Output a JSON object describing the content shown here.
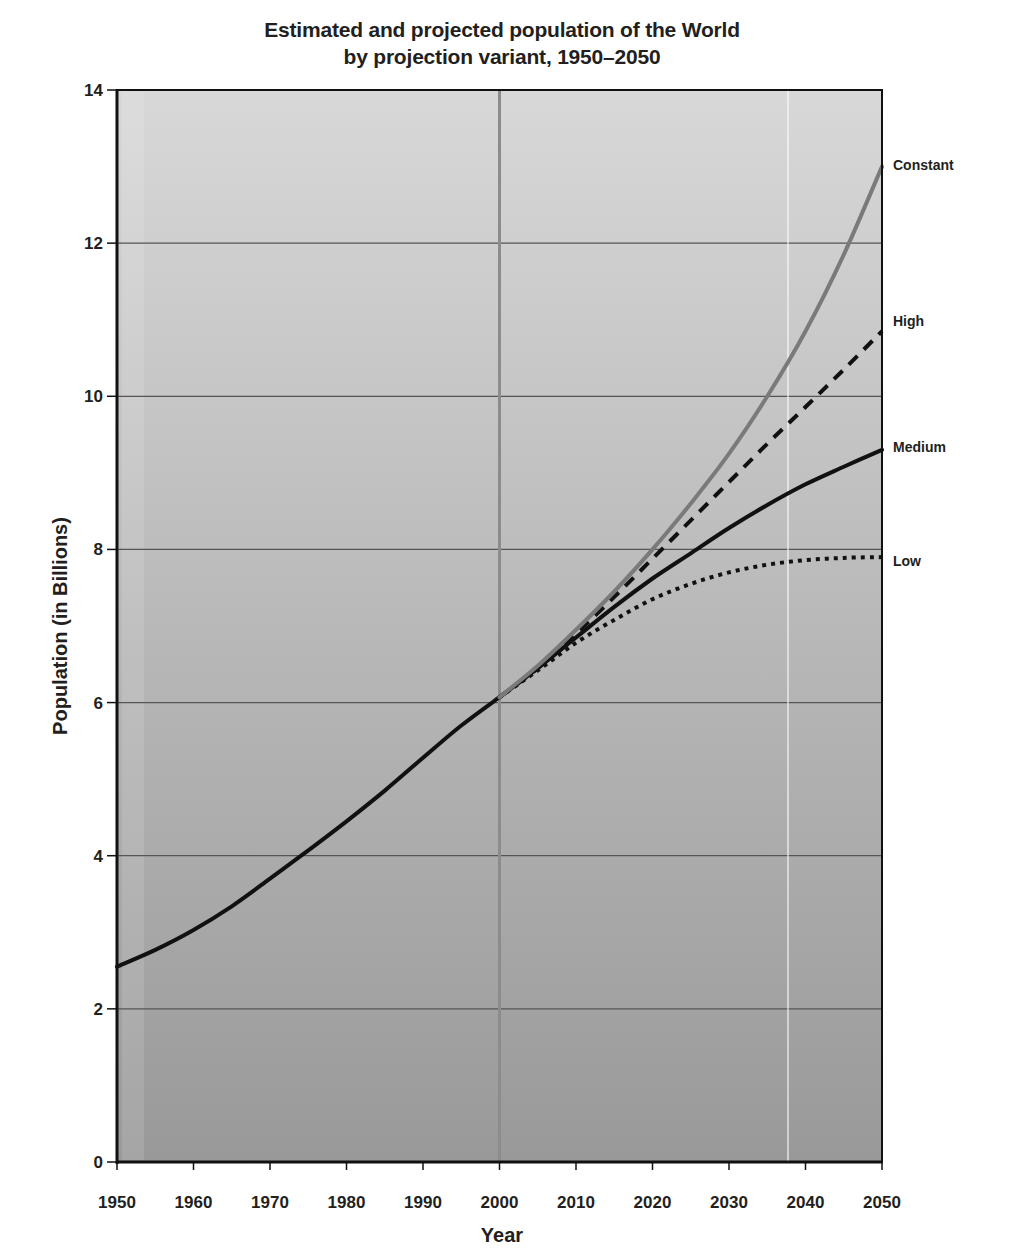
{
  "title": {
    "line1": "Estimated and projected population of the World",
    "line2": "by projection variant, 1950–2050"
  },
  "colors": {
    "background_top": "#d8d8d8",
    "background_bottom": "#999999",
    "estimate": "#111111",
    "constant": "#7a7a7a",
    "high": "#111111",
    "medium": "#111111",
    "low": "#111111",
    "gridline": "#555555",
    "year_2000_line": "#8c8c8c"
  },
  "chart_data": {
    "type": "line",
    "title": "Estimated and projected population of the World by projection variant, 1950–2050",
    "xlabel": "Year",
    "ylabel": "Population (in Billions)",
    "xlim": [
      1950,
      2050
    ],
    "ylim": [
      0,
      14
    ],
    "x_ticks": [
      "1950",
      "1960",
      "1970",
      "1980",
      "1990",
      "2000",
      "2010",
      "2020",
      "2030",
      "2040",
      "2050"
    ],
    "y_ticks": [
      "0",
      "2",
      "4",
      "6",
      "8",
      "10",
      "12",
      "14"
    ],
    "grid": "horizontal",
    "legend_position": "right, direct labels at line ends",
    "series": [
      {
        "name": "Estimate",
        "style": "solid black",
        "x": [
          1950,
          1955,
          1960,
          1965,
          1970,
          1975,
          1980,
          1985,
          1990,
          1995,
          2000
        ],
        "values": [
          2.55,
          2.77,
          3.03,
          3.34,
          3.7,
          4.07,
          4.45,
          4.85,
          5.28,
          5.7,
          6.07
        ]
      },
      {
        "name": "Constant",
        "style": "solid gray",
        "x": [
          2000,
          2005,
          2010,
          2015,
          2020,
          2025,
          2030,
          2035,
          2040,
          2045,
          2050
        ],
        "values": [
          6.07,
          6.48,
          6.95,
          7.45,
          8.0,
          8.6,
          9.25,
          10.0,
          10.85,
          11.85,
          13.0
        ]
      },
      {
        "name": "High",
        "style": "dashed black",
        "x": [
          2000,
          2005,
          2010,
          2015,
          2020,
          2025,
          2030,
          2035,
          2040,
          2045,
          2050
        ],
        "values": [
          6.07,
          6.45,
          6.9,
          7.38,
          7.88,
          8.38,
          8.88,
          9.38,
          9.86,
          10.35,
          10.85
        ]
      },
      {
        "name": "Medium",
        "style": "solid black",
        "x": [
          2000,
          2005,
          2010,
          2015,
          2020,
          2025,
          2030,
          2035,
          2040,
          2045,
          2050
        ],
        "values": [
          6.07,
          6.45,
          6.85,
          7.25,
          7.62,
          7.95,
          8.28,
          8.58,
          8.85,
          9.08,
          9.3
        ]
      },
      {
        "name": "Low",
        "style": "dotted black",
        "x": [
          2000,
          2005,
          2010,
          2015,
          2020,
          2025,
          2030,
          2035,
          2040,
          2045,
          2050
        ],
        "values": [
          6.07,
          6.42,
          6.78,
          7.08,
          7.35,
          7.55,
          7.7,
          7.8,
          7.86,
          7.89,
          7.9
        ]
      }
    ]
  }
}
